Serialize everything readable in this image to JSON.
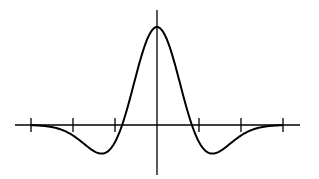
{
  "chart_data": {
    "type": "line",
    "title": "",
    "xlabel": "",
    "ylabel": "",
    "grid": false,
    "legend": null,
    "xlim": [
      -3,
      3
    ],
    "ylim": [
      -0.45,
      1.0
    ],
    "x_ticks": [
      -3,
      -2,
      -1,
      1,
      2,
      3
    ],
    "x_tick_labels": [
      "",
      "",
      "",
      "",
      "",
      ""
    ],
    "y_ticks": [],
    "series": [
      {
        "name": "curve",
        "x": [
          -3,
          -2.5,
          -2,
          -1.75,
          -1.5,
          -1.25,
          -1,
          -0.75,
          -0.5,
          -0.25,
          0,
          0.25,
          0.5,
          0.75,
          1,
          1.25,
          1.5,
          1.75,
          2,
          2.5,
          3
        ],
        "values": [
          0.0,
          -0.02,
          -0.16,
          -0.28,
          -0.39,
          -0.44,
          -0.3,
          0.05,
          0.45,
          0.85,
          1.0,
          0.85,
          0.45,
          0.05,
          -0.3,
          -0.44,
          -0.39,
          -0.28,
          -0.16,
          -0.02,
          0.0
        ]
      }
    ],
    "colors": {
      "line": "#000000",
      "axis": "#000000",
      "background": "#ffffff"
    }
  },
  "layout": {
    "origin_px": [
      157,
      125
    ],
    "x_unit_px": 42,
    "y_unit_px": 98
  }
}
